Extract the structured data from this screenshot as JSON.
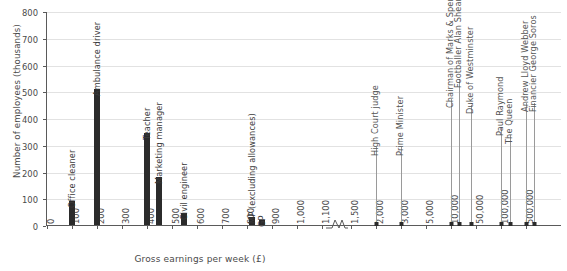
{
  "chart_data": {
    "type": "bar",
    "title": "",
    "xlabel": "Gross earnings per week (£)",
    "ylabel": "Number of employees (thousands)",
    "ylim": [
      0,
      800
    ],
    "ytick_values": [
      0,
      100,
      200,
      300,
      400,
      500,
      600,
      700,
      800
    ],
    "ytick_labels": [
      "0",
      "100",
      "200",
      "300",
      "400",
      "500",
      "600",
      "700",
      "800"
    ],
    "grid": "horizontal",
    "legend": "none",
    "x_axis_note": "Non-linear axis with a break (zigzag) between 1,100 and 1,500",
    "xtick_labels": [
      "0",
      "100",
      "200",
      "300",
      "400",
      "500",
      "600",
      "700",
      "800",
      "900",
      "1,000",
      "1,100",
      "1,500",
      "2,000",
      "3,000",
      "5,000",
      "10,000",
      "50,000",
      "100,000",
      "500,000"
    ],
    "bars": [
      {
        "label": "Office cleaner",
        "x": "100",
        "value": 88
      },
      {
        "label": "Ambulance driver",
        "x": "200",
        "value": 508
      },
      {
        "label": "Teacher",
        "x": "400",
        "value": 345
      },
      {
        "label": "Marketing manager",
        "x": "450",
        "value": 180
      },
      {
        "label": "Civil engineer",
        "x": "550",
        "value": 45
      },
      {
        "label": "MP (excluding allowances)",
        "x": "820",
        "value": 30
      },
      {
        "label": "GP",
        "x": "870",
        "value": 20
      }
    ],
    "markers": [
      {
        "label": "High Court judge",
        "x": "2,000"
      },
      {
        "label": "Prime Minister",
        "x": "3,000"
      },
      {
        "label": "Chairman of Marks & Spencer",
        "x": "10,000"
      },
      {
        "label": "Footballer Alan Shearer (excluding bonuses, etc.)",
        "x": "20,000"
      },
      {
        "label": "Duke of Westminster",
        "x": "40,000"
      },
      {
        "label": "Paul Raymond",
        "x": "100,000"
      },
      {
        "label": "The Queen",
        "x": "160,000"
      },
      {
        "label": "Andrew Lloyd Webber",
        "x": "500,000"
      },
      {
        "label": "Financier George Soros",
        "x": "700,000"
      }
    ],
    "colors": {
      "bar": "#2b2b2b",
      "marker": "#2b2b2b",
      "stem": "#9a9a9a",
      "grid": "#e2e2e2",
      "axis": "#5a5a5a",
      "text": "#4a4a4a",
      "background": "#ffffff"
    }
  }
}
